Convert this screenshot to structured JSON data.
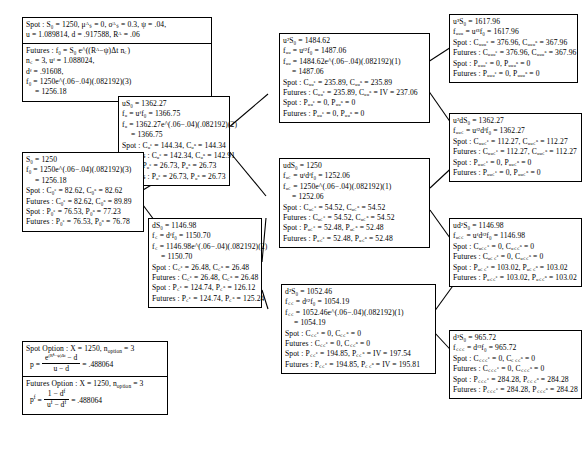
{
  "diagram": {
    "nodes": {
      "spot_params": {
        "name": "spot-parameters",
        "lines": [
          "Spot : S₀ = 1250,   μᴬₛ = 0, σᴬₛ = 0.3,  ψ = .04,",
          "u = 1.089814, d = .917588, Rᴬ = .06"
        ]
      },
      "futures_params": {
        "name": "futures-parameters",
        "lines": [
          "Futures : f₀ = S₀ e^((Rᴬ−ψ)Δt n꜀)",
          "n꜀ = 3,  uᶠ = 1.088024,",
          "dᶠ = .91608,",
          "f₀ = 1250e^(.06−.04)(.082192)(3)",
          "= 1256.18"
        ]
      },
      "u_s0": {
        "name": "node-uS0",
        "lines": [
          "uS₀ = 1362.27",
          "fᵤ = uᶠf₀ = 1366.75",
          "fᵤ = 1362.27e^(.06−.04)(.082192)(2)",
          "= 1366.75",
          "Spot : Cᵤᵉ = 144.34, Cᵤᵃ = 144.34",
          "Futures : Cᵤᵉ = 142.34, Cᵤᵃ = 142.91",
          "Spot : Pᵤᵉ = 26.73, Pᵤᵃ = 26.73",
          "Futures : Pᵤᵉ = 26.73, Pᵤᵃ = 26.73"
        ]
      },
      "s0": {
        "name": "node-S0",
        "lines": [
          "S₀ = 1250",
          "f₀ = 1250e^(.06−.04)(.082192)(3)",
          "= 1256.18",
          "Spot : C₀ᵉ = 82.62, C₀ᵃ = 82.62",
          "Futures : C₀ᵉ = 82.62, C₀ᵃ = 89.89",
          "Spot : P₀ᵉ = 76.53, P₀ᵃ = 77.23",
          "Futures : P₀ᵉ = 76.53, P₀ᵃ = 76.78"
        ]
      },
      "d_s0": {
        "name": "node-dS0",
        "lines": [
          "dS₀ = 1146.98",
          "f꜀ = dᶠf₀ = 1150.70",
          "f꜀ = 1146.98e^(.06−.04)(.082192)(2)",
          "= 1150.70",
          "Spot : C꜀ᵉ = 26.48, C꜀ᵃ = 26.48",
          "Futures : C꜀ᵉ = 26.48, C꜀ᵃ = 26.48",
          "Spot : P꜀ᵉ = 124.74, P꜀ᵃ = 126.12",
          "Futures : P꜀ᵉ = 124.74, P꜀ᵃ = 125.24"
        ]
      },
      "uu_s0": {
        "name": "node-u2S0",
        "lines": [
          "u²S₀ = 1484.62",
          "fᵤᵤ = uᶠ²f₀ = 1487.06",
          "fᵤᵤ = 1484.62e^(.06−.04)(.082192)(1)",
          "= 1487.06",
          "Spot : Cᵤᵤᵉ = 235.89, Cᵤᵤᵃ = 235.89",
          "Futures : Cᵤᵤᵉ = 235.89, Cᵤᵤᵃ = IV = 237.06",
          "Spot : Pᵤᵤᵉ = 0, Pᵤᵤᵃ = 0",
          "Futures : Pᵤᵤᵉ = 0, Pᵤᵤᵃ = 0"
        ]
      },
      "ud_s0": {
        "name": "node-udS0",
        "lines": [
          "udS₀ = 1250",
          "fᵤ꜀ = uᶠdᶠf₀ = 1252.06",
          "fᵤ꜀ = 1250e^(.06−.04)(.082192)(1)",
          "= 1252.06",
          "Spot : Cᵤ꜀ᵉ = 54.52, Cᵤ꜀ᵃ = 54.52",
          "Futures : Cᵤ꜀ᵉ = 54.52, Cᵤ꜀ᵃ = 54.52",
          "Spot : Pᵤ꜀ᵉ = 52.48, Pᵤ꜀ᵃ = 52.48",
          "Futures : Pᵤ꜀ᵉ = 52.48, Pᵤ꜀ᵃ = 52.48"
        ]
      },
      "dd_s0": {
        "name": "node-d2S0",
        "lines": [
          "d²S₀ = 1052.46",
          "f꜀꜀ = dᶠ²f₀ = 1054.19",
          "f꜀꜀ = 1052.46e^(.06−.04)(.082192)(1)",
          "= 1054.19",
          "Spot : C꜀꜀ᵉ = 0, C꜀꜀ᵃ = 0",
          "Futures : C꜀꜀ᵉ = 0, C꜀꜀ᵃ = 0",
          "Spot : P꜀꜀ᵉ = 194.85, P꜀꜀ᵃ = IV = 197.54",
          "Futures : P꜀꜀ᵉ = 194.85, P꜀꜀ᵃ = IV = 195.81"
        ]
      },
      "uuu_s0": {
        "name": "node-u3S0",
        "lines": [
          "u³S₀ = 1617.96",
          "fᵤᵤᵤ = uᶠ³f₀ = 1617.96",
          "Spot : Cᵤᵤᵤᵉ = 376.96, Cᵤᵤᵤᵃ = 367.96",
          "Futures : Cᵤᵤᵤᵉ = 376.96, Cᵤᵤᵤᵃ = 367.96",
          "Spot : Pᵤᵤᵤᵉ = 0, Pᵤᵤᵤᵃ = 0",
          "Futures : Pᵤᵤᵤᵉ = 0, Pᵤᵤᵤᵃ = 0"
        ]
      },
      "uud_s0": {
        "name": "node-u2dS0",
        "lines": [
          "u²dS₀ = 1362.27",
          "fᵤᵤ꜀ = uᶠ²dᶠf₀ = 1362.27",
          "Spot : Cᵤᵤ꜀ᵉ = 112.27, Cᵤᵤ꜀ᵃ = 112.27",
          "Futures : Cᵤᵤ꜀ᵉ = 112.27, Cᵤᵤ꜀ᵃ = 112.27",
          "Spot : Pᵤᵤ꜀ᵉ = 0, Pᵤᵤ꜀ᵃ = 0",
          "Futures : Pᵤᵤ꜀ᵉ = 0, Pᵤᵤ꜀ᵃ = 0"
        ]
      },
      "udd_s0": {
        "name": "node-ud2S0",
        "lines": [
          "ud²S₀ = 1146.98",
          "fᵤ꜀꜀ = uᶠdᶠ²f₀ = 1146.98",
          "Spot : Cᵤ꜀꜀ᵉ = 0, Cᵤ꜀꜀ᵃ = 0",
          "Futures : Cᵤ꜀꜀ᵉ = 0, Cᵤ꜀꜀ᵃ = 0",
          "Spot : Pᵤ꜀꜀ᵉ = 103.02, Pᵤ꜀꜀ᵃ = 103.02",
          "Futures : Pᵤ꜀꜀ᵉ = 103.02, Pᵤ꜀꜀ᵃ = 103.02"
        ]
      },
      "ddd_s0": {
        "name": "node-d3S0",
        "lines": [
          "d³S₀ = 965.72",
          "f꜀꜀꜀ = dᶠ³f₀ = 965.72",
          "Spot : C꜀꜀꜀ᵉ = 0, C꜀꜀꜀ᵃ = 0",
          "Futures : C꜀꜀꜀ᵉ = 0, C꜀꜀꜀ᵃ = 0",
          "Spot : P꜀꜀꜀ᵉ = 284.28, P꜀꜀꜀ᵃ = 284.28",
          "Futures : P꜀꜀꜀ᵉ = 284.28, P꜀꜀꜀ᵃ = 284.28"
        ]
      },
      "spot_option": {
        "name": "spot-option-box",
        "header": "Spot Option : X = 1250,  n",
        "header_sub": "option",
        "header_val": " = 3",
        "p_label": "p",
        "p_eq": "=",
        "num": "e",
        "num_exp": "(Rᴬ−ψ)Δt",
        "num_minus_d": "d",
        "den": "u − d",
        "p_value": "= .488064"
      },
      "futures_option": {
        "name": "futures-option-box",
        "header": "Futures Option : X = 1250,  n",
        "header_sub": "option",
        "header_val": " = 3",
        "p_label": "p",
        "p_sup": "f",
        "p_eq": "=",
        "num": "1 − d",
        "num_sup": "f",
        "den": "u",
        "den_sup": "f",
        "den2": " − d",
        "den2_sup": "f",
        "p_value": "= .488064"
      }
    }
  }
}
